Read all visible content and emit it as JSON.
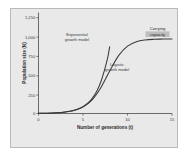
{
  "figure": {
    "panel_background": "#e9e9e9",
    "panel_border": "#b9b9b9",
    "page_background": "#ffffff"
  },
  "chart_data": {
    "type": "line",
    "title": "",
    "xlabel": "Number of generations (t)",
    "ylabel": "Population size (N)",
    "xlim": [
      0,
      15
    ],
    "ylim": [
      0,
      1300
    ],
    "xticks": [
      0,
      5,
      10,
      15
    ],
    "xtick_labels": [
      "0",
      "5",
      "10",
      "15"
    ],
    "yticks": [
      0,
      250,
      500,
      750,
      1000,
      1250
    ],
    "ytick_labels": [
      "0",
      "250",
      "500",
      "750",
      "1,000",
      "1,250"
    ],
    "grid": false,
    "legend": "none",
    "carrying_capacity": 960,
    "series": [
      {
        "name": "Exponential growth model",
        "color": "#3a3a3a",
        "x": [
          0,
          0.5,
          1,
          1.5,
          2,
          2.5,
          3,
          3.5,
          4,
          4.5,
          5,
          5.5,
          6,
          6.5,
          7,
          7.5,
          7.8,
          8.0
        ],
        "values": [
          2,
          3,
          4,
          6,
          9,
          13,
          19,
          28,
          41,
          60,
          88,
          129,
          189,
          277,
          405,
          594,
          732,
          860
        ]
      },
      {
        "name": "Logistic growth model",
        "color": "#3a3a3a",
        "x": [
          0,
          1,
          2,
          3,
          4,
          5,
          6,
          7,
          8,
          9,
          10,
          11,
          12,
          13,
          14,
          15
        ],
        "values": [
          2,
          4,
          9,
          19,
          40,
          84,
          172,
          331,
          547,
          745,
          868,
          925,
          947,
          955,
          958,
          960
        ]
      }
    ],
    "annotations": [
      {
        "id": "exponential-label",
        "text_line1": "Exponential",
        "text_line2": "growth model",
        "x": 4.3,
        "y": 1085,
        "highlighted": false
      },
      {
        "id": "logistic-label",
        "text_line1": "Logistic",
        "text_line2": "growth model",
        "x": 9.3,
        "y": 640,
        "highlighted": false
      },
      {
        "id": "carrying-capacity-label",
        "text_line1": "Carrying",
        "text_line2": "capacity",
        "x": 13.3,
        "y": 1180,
        "highlighted": true
      }
    ]
  }
}
